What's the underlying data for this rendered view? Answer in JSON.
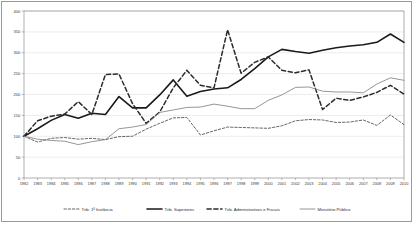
{
  "chart_data": {
    "type": "line",
    "title": "",
    "xlabel": "",
    "ylabel": "",
    "ylim": [
      0,
      400
    ],
    "ytick_step": 50,
    "yticks": [
      0,
      50,
      100,
      150,
      200,
      250,
      300,
      350,
      400
    ],
    "grid": true,
    "legend_position": "bottom",
    "categories": [
      "1982",
      "1983",
      "1984",
      "1985",
      "1986",
      "1987",
      "1988",
      "1989",
      "1990",
      "1991",
      "1992",
      "1993",
      "1994",
      "1995",
      "1996",
      "1997",
      "1998",
      "1999",
      "2000",
      "2001",
      "2002",
      "2003",
      "2004",
      "2005",
      "2006",
      "2007",
      "2008",
      "2009",
      "2010"
    ],
    "series": [
      {
        "name": "Trib. 1ª Instância",
        "style": "dashed",
        "color": "#555555",
        "width": 0.9,
        "dash": "2.4,1.8",
        "values": [
          100,
          86,
          95,
          97,
          93,
          95,
          92,
          99,
          100,
          117,
          131,
          144,
          145,
          103,
          113,
          122,
          121,
          120,
          119,
          125,
          137,
          140,
          139,
          133,
          134,
          139,
          126,
          151,
          128
        ]
      },
      {
        "name": "Trib. Superiores",
        "style": "solid",
        "color": "#1a1a1a",
        "width": 1.6,
        "dash": "",
        "values": [
          100,
          118,
          138,
          152,
          143,
          155,
          152,
          195,
          168,
          168,
          199,
          235,
          196,
          207,
          213,
          216,
          236,
          262,
          290,
          308,
          303,
          299,
          306,
          312,
          316,
          319,
          325,
          345,
          325
        ]
      },
      {
        "name": "Trib. Administrativos e Fiscais",
        "style": "dashed",
        "color": "#2b2b2b",
        "width": 1.5,
        "dash": "4.2,2.6",
        "values": [
          100,
          137,
          148,
          153,
          183,
          152,
          248,
          249,
          178,
          131,
          158,
          216,
          258,
          222,
          216,
          355,
          251,
          277,
          290,
          258,
          252,
          259,
          164,
          191,
          186,
          194,
          205,
          222,
          201
        ]
      },
      {
        "name": "Ministério Público",
        "style": "solid",
        "color": "#8a8a8a",
        "width": 0.9,
        "dash": "",
        "values": [
          100,
          93,
          90,
          88,
          80,
          87,
          92,
          118,
          122,
          128,
          157,
          163,
          169,
          170,
          177,
          172,
          166,
          166,
          186,
          199,
          217,
          218,
          208,
          206,
          206,
          204,
          225,
          240,
          234
        ]
      }
    ]
  },
  "legend": {
    "items": [
      {
        "label": "Trib. 1ª Instância"
      },
      {
        "label": "Trib. Superiores"
      },
      {
        "label": "Trib. Administrativos e Fiscais"
      },
      {
        "label": "Ministério Público"
      }
    ]
  }
}
